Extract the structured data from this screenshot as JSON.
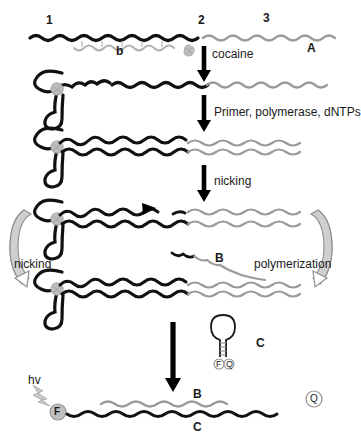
{
  "figure": {
    "title_hidden": "",
    "colors": {
      "strand_black": "#111111",
      "strand_gray": "#9a9a9a",
      "cocaine_gray": "#b4b4b4",
      "arrow_black": "#000000",
      "curved_arrow_gray": "#a8a8a8",
      "fluorophore_fill": "#bdbdbd",
      "quencher_fill": "#ffffff",
      "text": "#1a1a1a"
    }
  },
  "panel_a": {
    "domain_1_label": "1",
    "domain_2_label": "2",
    "domain_3_label": "3",
    "blocker_label": "b",
    "panel_label": "A"
  },
  "steps": {
    "step1_label": "cocaine",
    "step1_icon": "cocaine-molecule-icon",
    "step2_label": "Primer, polymerase, dNTPs",
    "step3_label": "nicking",
    "step4_label": "nicking",
    "step5_label": "polymerization",
    "nick_site_icon": "nick-triangle-icon"
  },
  "intermediate": {
    "released_strand_label": "B"
  },
  "hairpin": {
    "label": "C",
    "fluorophore_label": "F",
    "quencher_label": "Q"
  },
  "product": {
    "excitation_label": "hv",
    "excitation_icon": "light-bolt-icon",
    "fluorophore_label": "F",
    "quencher_label": "Q",
    "top_strand_label": "B",
    "bottom_strand_label": "C"
  }
}
